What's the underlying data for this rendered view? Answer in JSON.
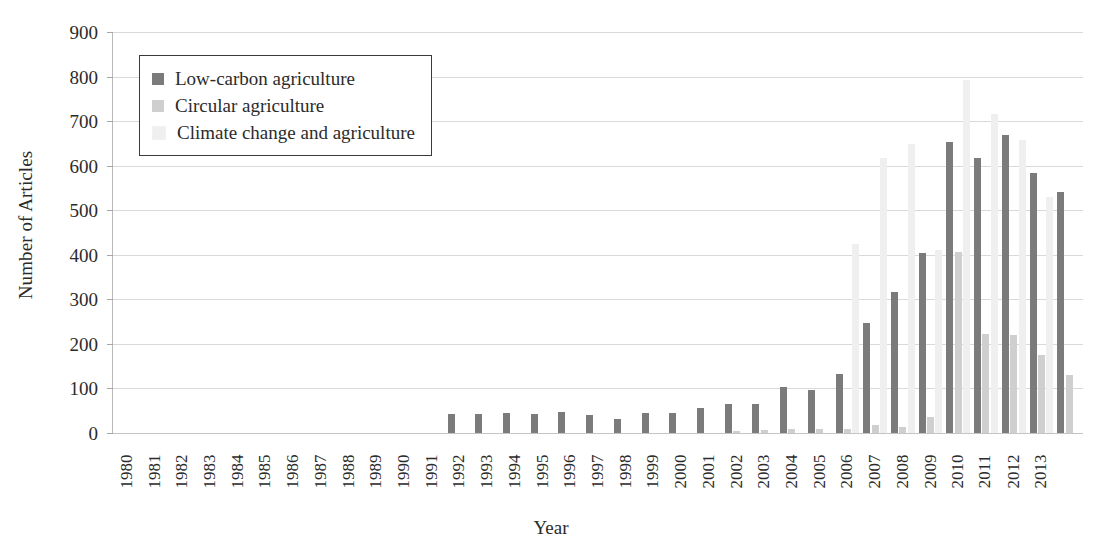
{
  "chart_data": {
    "type": "bar",
    "title": "",
    "subtitle": "",
    "xlabel": "Year",
    "ylabel": "Number of Articles",
    "ylim": [
      0,
      900
    ],
    "ytick_step": 100,
    "yticks": [
      900,
      800,
      700,
      600,
      500,
      400,
      300,
      200,
      100,
      0
    ],
    "grid": true,
    "legend_position": "top-left",
    "categories": [
      "1980",
      "1981",
      "1982",
      "1983",
      "1984",
      "1985",
      "1986",
      "1987",
      "1988",
      "1989",
      "1990",
      "1991",
      "1992",
      "1993",
      "1994",
      "1995",
      "1996",
      "1997",
      "1998",
      "1999",
      "2000",
      "2001",
      "2002",
      "2003",
      "2004",
      "2005",
      "2006",
      "2007",
      "2008",
      "2009",
      "2010",
      "2011",
      "2012",
      "2013",
      "2014"
    ],
    "series": [
      {
        "name": "Low-carbon agriculture",
        "color": "#7b7b7b",
        "values": [
          0,
          0,
          0,
          0,
          0,
          0,
          0,
          0,
          0,
          0,
          0,
          0,
          42,
          42,
          44,
          43,
          48,
          40,
          32,
          44,
          46,
          57,
          65,
          65,
          103,
          96,
          132,
          246,
          316,
          404,
          654,
          618,
          668,
          583,
          542
        ]
      },
      {
        "name": "Circular agriculture",
        "color": "#cfcfcf",
        "values": [
          0,
          0,
          0,
          0,
          0,
          0,
          0,
          0,
          0,
          0,
          0,
          0,
          0,
          0,
          0,
          0,
          0,
          0,
          0,
          0,
          0,
          0,
          4,
          7,
          8,
          8,
          10,
          18,
          14,
          36,
          406,
          222,
          219,
          175,
          131
        ]
      },
      {
        "name": "Climate change and agriculture",
        "color": "#efefef",
        "values": [
          0,
          0,
          0,
          0,
          0,
          0,
          0,
          0,
          0,
          0,
          0,
          0,
          0,
          0,
          0,
          0,
          0,
          0,
          0,
          0,
          0,
          0,
          0,
          0,
          0,
          0,
          424,
          617,
          648,
          410,
          792,
          716,
          657,
          530,
          0
        ]
      }
    ]
  },
  "legend": {
    "items": [
      {
        "label": "Low-carbon agriculture",
        "color": "#7b7b7b"
      },
      {
        "label": "Circular agriculture",
        "color": "#cfcfcf"
      },
      {
        "label": "Climate change and agriculture",
        "color": "#efefef"
      }
    ]
  },
  "axes": {
    "y_title": "Number of Articles",
    "x_title": "Year"
  }
}
